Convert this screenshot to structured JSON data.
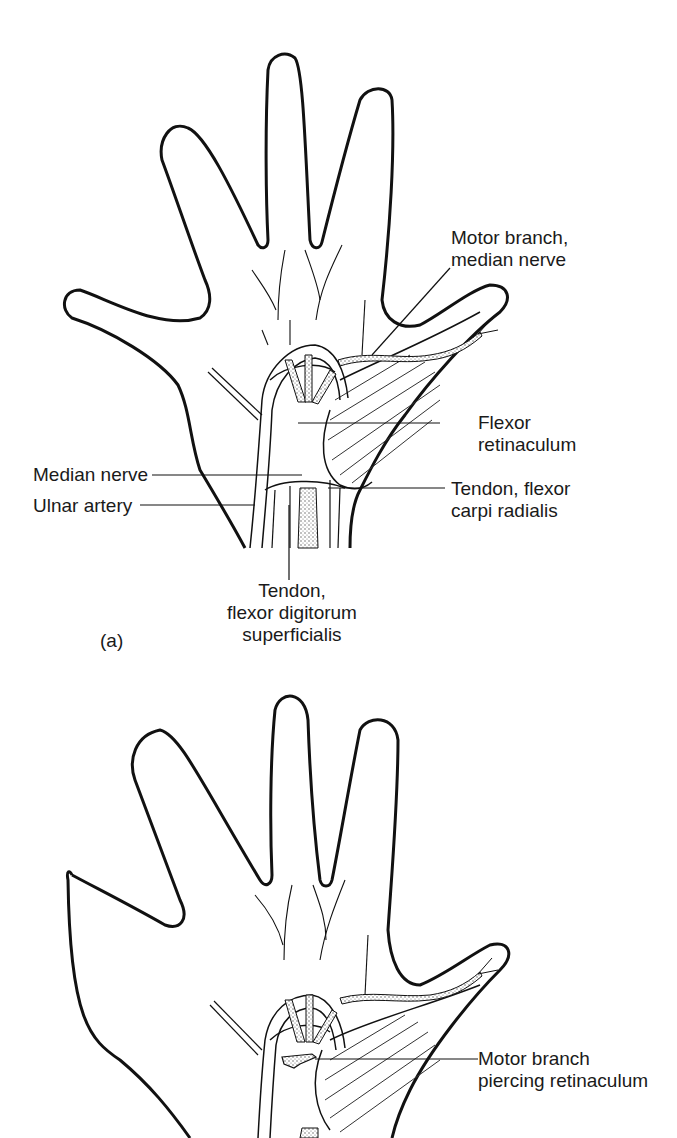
{
  "figure": {
    "panel_a": {
      "panel_label": "(a)",
      "labels": {
        "motor_branch_1": "Motor branch,",
        "motor_branch_2": "median nerve",
        "flexor_ret_1": "Flexor",
        "flexor_ret_2": "retinaculum",
        "median_nerve": "Median nerve",
        "ulnar_artery": "Ulnar artery",
        "fcr_1": "Tendon, flexor",
        "fcr_2": "carpi radialis",
        "fds_1": "Tendon,",
        "fds_2": "flexor digitorum",
        "fds_3": "superficialis"
      }
    },
    "panel_b": {
      "labels": {
        "piercing_1": "Motor branch",
        "piercing_2": "piercing retinaculum"
      }
    },
    "colors": {
      "outline": "#111111",
      "stipple": "#555555",
      "background": "#ffffff"
    }
  }
}
